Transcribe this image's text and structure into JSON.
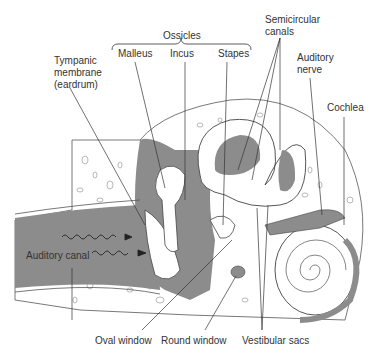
{
  "diagram": {
    "labels": {
      "ossicles": "Ossicles",
      "malleus": "Malleus",
      "incus": "Incus",
      "stapes": "Stapes",
      "tympanic_line1": "Tympanic",
      "tympanic_line2": "membrane",
      "tympanic_line3": "(eardrum)",
      "semicircular_line1": "Semicircular",
      "semicircular_line2": "canals",
      "auditory_nerve_line1": "Auditory",
      "auditory_nerve_line2": "nerve",
      "cochlea": "Cochlea",
      "auditory_canal": "Auditory canal",
      "oval_window": "Oval window",
      "round_window": "Round window",
      "vestibular_sacs": "Vestibular sacs"
    },
    "colors": {
      "tissue_gray": "#8c8c8c",
      "bone_white": "#ffffff",
      "line": "#333333",
      "text": "#333333"
    }
  }
}
